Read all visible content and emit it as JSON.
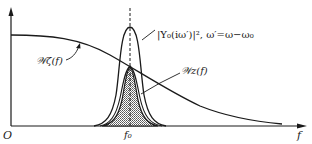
{
  "figure": {
    "type": "spectral density diagram",
    "axes": {
      "origin_label": "O",
      "x_axis_label": "f",
      "center_tick_label": "f₀"
    },
    "curves": [
      {
        "id": "input-spectrum",
        "label": "𝒲ζ(f)",
        "description": "broad, slowly decaying spectrum"
      },
      {
        "id": "filter-response",
        "label": "|Y₀(iω′)|², ω′=ω−ω₀",
        "description": "narrow resonance peak centered at f₀"
      },
      {
        "id": "output-spectrum",
        "label": "𝒲z(f)",
        "description": "shaded product spectrum centered at f₀"
      }
    ],
    "colors": {
      "ink": "#1a1a1a",
      "background": "#ffffff",
      "shade": "#8a8a8a"
    }
  }
}
